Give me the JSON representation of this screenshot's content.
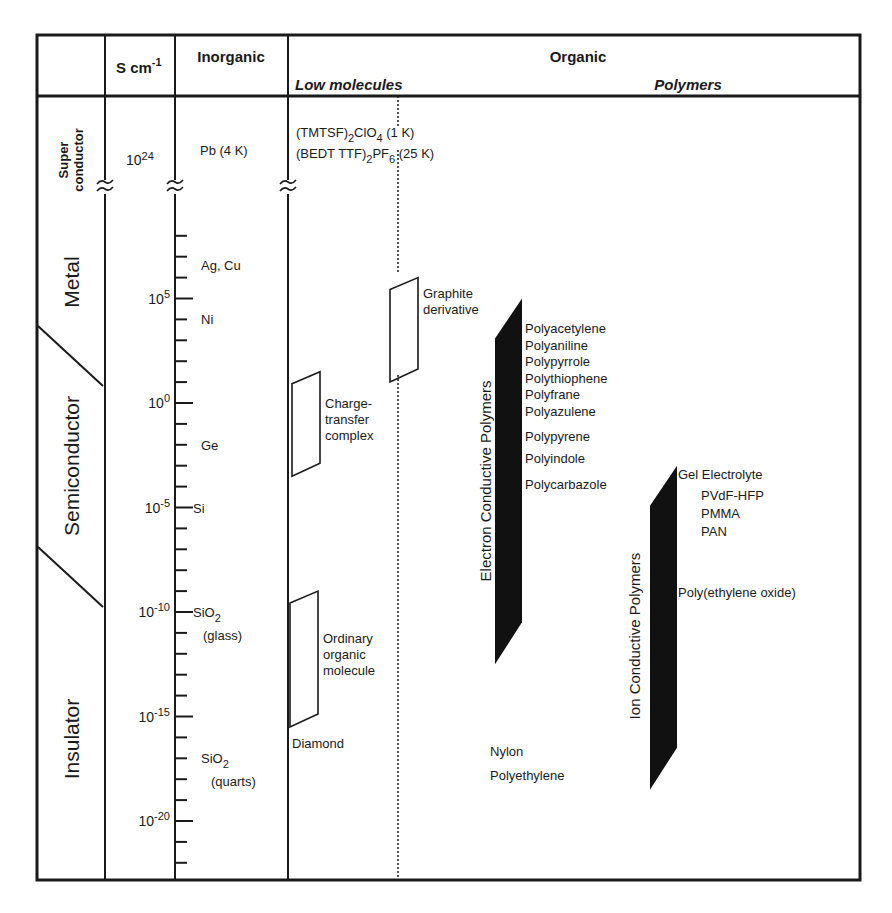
{
  "header": {
    "unit": "S cm",
    "unit_exp": "-1",
    "inorganic": "Inorganic",
    "organic": "Organic",
    "low_molecules": "Low molecules",
    "polymers": "Polymers"
  },
  "classes": {
    "superconductor_line1": "Super",
    "superconductor_line2": "conductor",
    "metal": "Metal",
    "semiconductor": "Semiconductor",
    "insulator": "Insulator"
  },
  "scale": {
    "superconductor_value_base": "10",
    "superconductor_value_exp": "24",
    "major_ticks": [
      {
        "base": "10",
        "exp": "5",
        "log": 5
      },
      {
        "base": "10",
        "exp": "0",
        "log": 0
      },
      {
        "base": "10",
        "exp": "-5",
        "log": -5
      },
      {
        "base": "10",
        "exp": "-10",
        "log": -10
      },
      {
        "base": "10",
        "exp": "-15",
        "log": -15
      },
      {
        "base": "10",
        "exp": "-20",
        "log": -20
      }
    ],
    "log_min": -22,
    "log_max": 8
  },
  "inorganic": {
    "superconductor": "Pb (4 K)",
    "materials": [
      {
        "name": "Ag, Cu",
        "sub": "",
        "note": "",
        "log": 6.6
      },
      {
        "name": "Ni",
        "sub": "",
        "note": "",
        "log": 4
      },
      {
        "name": "Ge",
        "sub": "",
        "note": "",
        "log": -2
      },
      {
        "name": "Si",
        "sub": "",
        "note": "",
        "log": -5
      },
      {
        "name": "SiO",
        "sub": "2",
        "note": "(glass)",
        "log": -10
      },
      {
        "name": "SiO",
        "sub": "2",
        "note": "(quarts)",
        "log": -17
      }
    ]
  },
  "low_molecules": {
    "superconductors": [
      {
        "prefix": "(TMTSF)",
        "sub1": "2",
        "mid": "ClO",
        "sub2": "4",
        "suffix": " (1 K)"
      },
      {
        "prefix": "(BEDT TTF)",
        "sub1": "2",
        "mid": "PF",
        "sub2": "6",
        "suffix": " (25 K)"
      }
    ],
    "ranges": [
      {
        "name": "graphite",
        "label_lines": [
          "Graphite",
          "derivative"
        ],
        "log_high": 6,
        "log_low": 1
      },
      {
        "name": "charge-transfer",
        "label_lines": [
          "Charge-",
          "transfer",
          "complex"
        ],
        "log_high": 1.5,
        "log_low": -3.5
      },
      {
        "name": "ordinary-organic",
        "label_lines": [
          "Ordinary",
          "organic",
          "molecule"
        ],
        "log_high": -9,
        "log_low": -15.5
      }
    ],
    "diamond": "Diamond"
  },
  "polymers": {
    "electron": {
      "title": "Electron Conductive Polymers",
      "log_high": 5,
      "log_low": -12.5,
      "items": [
        "Polyacetylene",
        "Polyaniline",
        "Polypyrrole",
        "Polythiophene",
        "Polyfrane",
        "Polyazulene",
        "Polypyrene",
        "Polyindole",
        "Polycarbazole"
      ]
    },
    "ion": {
      "title": "Ion Conductive Polymers",
      "log_high": -3,
      "log_low": -18.5,
      "gel_title": "Gel Electrolyte",
      "gel_items": [
        "PVdF-HFP",
        "PMMA",
        "PAN"
      ],
      "peo": "Poly(ethylene oxide)"
    },
    "insulating": [
      "Nylon",
      "Polyethylene"
    ]
  }
}
